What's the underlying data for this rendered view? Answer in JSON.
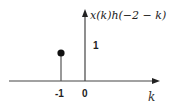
{
  "diagram": {
    "y_axis_label": "x(k)h(−2 − k)",
    "x_axis_label": "k",
    "value_label": "1",
    "ticks": [
      {
        "label": "-1",
        "k": -1
      },
      {
        "label": "0",
        "k": 0
      }
    ],
    "samples": [
      {
        "k": -1,
        "value": 1
      }
    ],
    "colors": {
      "axis": "#444444",
      "stem": "#555555",
      "marker": "#111111"
    }
  }
}
